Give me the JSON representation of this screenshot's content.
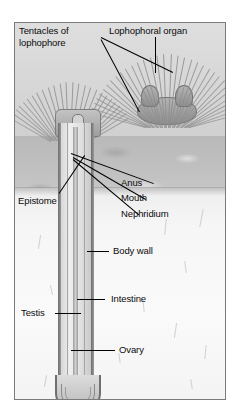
{
  "figure": {
    "title_alt": "Phoronid anatomy diagram",
    "frame_color": "#7b7b7b",
    "background_color": "#ffffff",
    "label_color": "#0b0b0b"
  },
  "labels": {
    "tentacles": "Tentacles of\nlophophore",
    "lophophoral_organ": "Lophophoral organ",
    "anus": "Anus",
    "mouth": "Mouth",
    "nephridium": "Nephridium",
    "epistome": "Epistome",
    "body_wall": "Body wall",
    "intestine": "Intestine",
    "testis": "Testis",
    "ovary": "Ovary"
  }
}
